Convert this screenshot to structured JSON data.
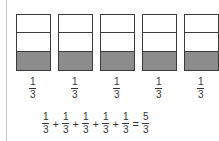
{
  "figure": {
    "boxes": [
      {
        "parts": 3,
        "shaded": 1
      },
      {
        "parts": 3,
        "shaded": 1
      },
      {
        "parts": 3,
        "shaded": 1
      },
      {
        "parts": 3,
        "shaded": 1
      },
      {
        "parts": 3,
        "shaded": 1
      }
    ],
    "shade_color": "#8c8c8c",
    "labels": [
      {
        "num": "1",
        "den": "3"
      },
      {
        "num": "1",
        "den": "3"
      },
      {
        "num": "1",
        "den": "3"
      },
      {
        "num": "1",
        "den": "3"
      },
      {
        "num": "1",
        "den": "3"
      }
    ],
    "equation": {
      "terms": [
        {
          "num": "1",
          "den": "3"
        },
        {
          "num": "1",
          "den": "3"
        },
        {
          "num": "1",
          "den": "3"
        },
        {
          "num": "1",
          "den": "3"
        },
        {
          "num": "1",
          "den": "3"
        }
      ],
      "plus": "+",
      "equals": "=",
      "result": {
        "num": "5",
        "den": "3"
      }
    }
  }
}
